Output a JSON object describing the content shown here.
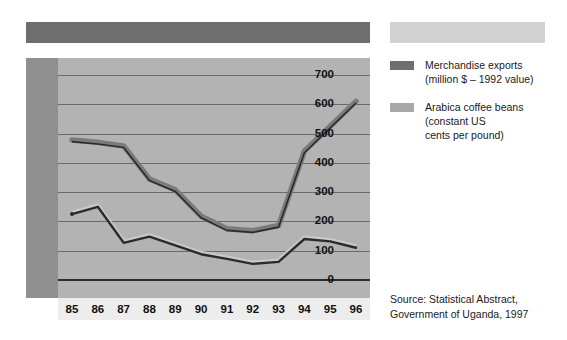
{
  "banners": {
    "top_left_color": "#6e6e6e",
    "top_right_color": "#d2d2d2"
  },
  "legend": {
    "position": "right",
    "items": [
      {
        "swatch_color": "#6e6e6e",
        "line1": "Merchandise exports",
        "line2": "(million $ – 1992 value)",
        "line3": ""
      },
      {
        "swatch_color": "#a8a8a8",
        "line1": "Arabica coffee beans",
        "line2": "(constant US",
        "line3": "cents per pound)"
      }
    ]
  },
  "source": {
    "line1": "Source: Statistical Abstract,",
    "line2": "Government of Uganda, 1997"
  },
  "chart_data": {
    "type": "line",
    "title": "",
    "subtitle": "",
    "xlabel": "",
    "ylabel": "",
    "x": [
      "85",
      "86",
      "87",
      "88",
      "89",
      "90",
      "91",
      "92",
      "93",
      "94",
      "95",
      "96"
    ],
    "categories": [
      "85",
      "86",
      "87",
      "88",
      "89",
      "90",
      "91",
      "92",
      "93",
      "94",
      "95",
      "96"
    ],
    "ylim": [
      0,
      700
    ],
    "yticks": [
      0,
      100,
      200,
      300,
      400,
      500,
      600,
      700
    ],
    "ytick_labels": [
      "0",
      "100",
      "200",
      "300",
      "400",
      "500",
      "600",
      "700"
    ],
    "grid": true,
    "grid_color": "#6a6a6a",
    "plot_bg": "#b3b3b3",
    "axis_band_bg": "#8f8f8f",
    "xstrip_bg": "#ededed",
    "series": [
      {
        "name": "Merchandise exports",
        "units": "million $ – 1992 value",
        "color": "#2b2b2b",
        "width": 2.4,
        "values": [
          225,
          250,
          127,
          148,
          118,
          88,
          72,
          55,
          62,
          140,
          132,
          110
        ]
      },
      {
        "name": "Arabica coffee beans",
        "units": "constant US cents per pound",
        "color": "#7b7b7b",
        "width": 5.5,
        "values": [
          478,
          470,
          458,
          345,
          308,
          218,
          175,
          168,
          186,
          440,
          525,
          610
        ]
      }
    ]
  }
}
